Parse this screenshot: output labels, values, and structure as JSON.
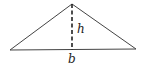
{
  "diagram": {
    "type": "triangle-with-altitude",
    "labels": {
      "height": "h",
      "base": "b"
    },
    "colors": {
      "stroke": "#444444",
      "background": "#ffffff"
    },
    "geometry": {
      "apex": [
        72,
        4
      ],
      "base_left": [
        10,
        50
      ],
      "base_right": [
        136,
        49
      ],
      "altitude_foot": [
        72,
        50
      ]
    }
  }
}
